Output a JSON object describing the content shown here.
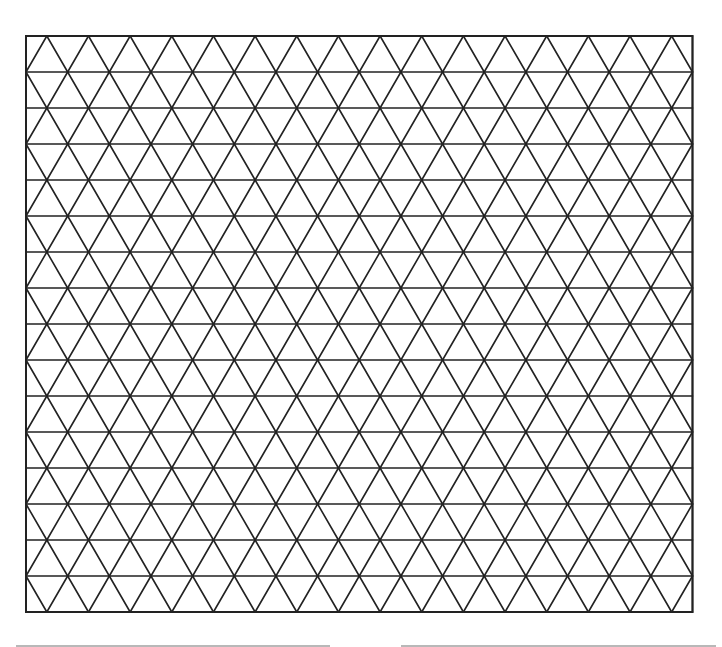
{
  "figure": {
    "type": "isometric-triangle-grid",
    "stroke_color": "#222222",
    "background": "#ffffff",
    "frame": {
      "x": 26,
      "y": 36,
      "width": 666.5,
      "height": 576
    },
    "rows": 16,
    "columns": 16
  },
  "footer_lines": [
    {
      "x": 16,
      "width": 314
    },
    {
      "x": 401,
      "width": 315
    }
  ]
}
